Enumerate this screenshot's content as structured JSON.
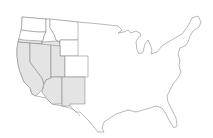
{
  "map": {
    "title": "",
    "region": "Contiguous United States",
    "colors": {
      "background": "#ffffff",
      "highlight_fill": "#e4e4e4",
      "default_fill": "#ffffff",
      "stroke": "#7a7a7a"
    },
    "highlighted_states": [
      "California",
      "Nevada",
      "Arizona",
      "New Mexico",
      "Oregon (southern portion)",
      "Idaho (southern portion)",
      "Utah"
    ],
    "outlined_states": [
      "Washington",
      "Oregon",
      "California",
      "Idaho",
      "Nevada",
      "Utah",
      "Arizona",
      "New Mexico",
      "Montana",
      "Wyoming",
      "Colorado"
    ]
  }
}
